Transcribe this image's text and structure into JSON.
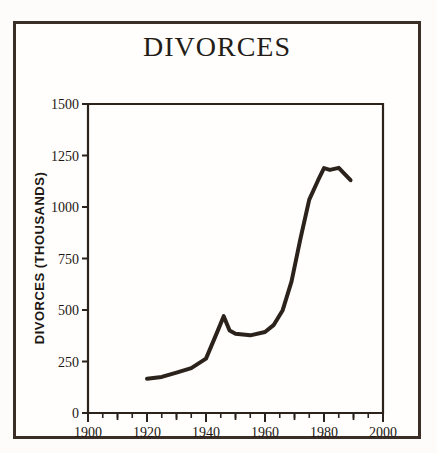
{
  "chart_data": {
    "type": "line",
    "title": "DIVORCES",
    "xlabel": "",
    "ylabel": "DIVORCES  (THOUSANDS)",
    "xlim": [
      1900,
      2000
    ],
    "ylim": [
      0,
      1500
    ],
    "xticks": [
      1900,
      1910,
      1920,
      1930,
      1940,
      1950,
      1960,
      1970,
      1980,
      1990,
      2000
    ],
    "xtick_labels": [
      "1900",
      "",
      "1920",
      "",
      "1940",
      "",
      "1960",
      "",
      "1980",
      "",
      "2000"
    ],
    "xtick_labels_major": [
      "1900",
      "1920",
      "1940",
      "1960",
      "1980",
      "2000"
    ],
    "xticks_major": [
      1900,
      1920,
      1940,
      1960,
      1980,
      2000
    ],
    "xticks_minor": [
      1905,
      1910,
      1915,
      1925,
      1930,
      1935,
      1945,
      1950,
      1955,
      1965,
      1970,
      1975,
      1985,
      1990,
      1995
    ],
    "yticks": [
      0,
      250,
      500,
      750,
      1000,
      1250,
      1500
    ],
    "ytick_labels": [
      "0",
      "250",
      "500",
      "750",
      "1000",
      "1250",
      "1500"
    ],
    "grid": false,
    "legend": false,
    "line_color": "#2b221c",
    "line_width": 4,
    "series": [
      {
        "name": "Divorces",
        "x": [
          1920,
          1925,
          1930,
          1935,
          1940,
          1944,
          1946,
          1948,
          1950,
          1955,
          1960,
          1963,
          1966,
          1969,
          1972,
          1975,
          1978,
          1980,
          1982,
          1985,
          1989
        ],
        "values": [
          166,
          175,
          196,
          218,
          264,
          400,
          470,
          400,
          385,
          377,
          393,
          428,
          499,
          639,
          845,
          1036,
          1130,
          1189,
          1180,
          1190,
          1130
        ]
      }
    ]
  },
  "frame": {
    "border_color": "#3a2e27",
    "background": "#fffefc"
  }
}
